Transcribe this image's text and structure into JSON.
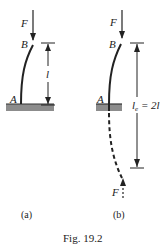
{
  "figure": {
    "caption": "Fig. 19.2",
    "colors": {
      "ink": "#222222",
      "ground": "#8c8c8c"
    },
    "panels": [
      {
        "id": "a",
        "sublabel": "(a)",
        "force_label": "F",
        "top_point_label": "B",
        "base_point_label": "A",
        "dimension_label": "l"
      },
      {
        "id": "b",
        "sublabel": "(b)",
        "force_label": "F",
        "reflected_force_label": "F",
        "top_point_label": "B",
        "base_point_label": "A",
        "dimension_label_main": "l",
        "dimension_label_sub": "e",
        "dimension_label_rest": " = 2l"
      }
    ]
  }
}
